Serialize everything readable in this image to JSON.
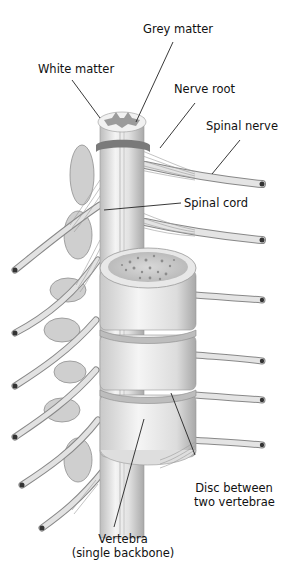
{
  "diagram": {
    "labels": {
      "grey_matter": "Grey matter",
      "white_matter": "White matter",
      "nerve_root": "Nerve root",
      "spinal_nerve": "Spinal nerve",
      "spinal_cord": "Spinal cord",
      "disc_line1": "Disc between",
      "disc_line2": "two vertebrae",
      "vertebra_line1": "Vertebra",
      "vertebra_line2": "(single backbone)"
    },
    "colors": {
      "background": "#ffffff",
      "bone_light": "#ececec",
      "bone_mid": "#cfcfcf",
      "bone_dark": "#9a9a9a",
      "grey_matter": "#9b9b9b",
      "leader_line": "#222222",
      "text": "#111111"
    }
  }
}
